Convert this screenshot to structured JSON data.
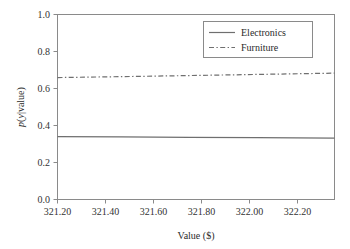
{
  "chart_data": {
    "type": "line",
    "title": "",
    "xlabel": "Value ($)",
    "ylabel": "p(y|value)",
    "ylabel_parts": {
      "p": "p",
      "open": "(",
      "y": "y",
      "rest": "|value)"
    },
    "xlim": [
      321.12,
      322.34
    ],
    "ylim": [
      0.0,
      1.0
    ],
    "grid": false,
    "legend_position": "upper right",
    "xticks": [
      321.2,
      321.4,
      321.6,
      321.8,
      322.0,
      322.2
    ],
    "xticklabels": [
      "321.20",
      "321.40",
      "321.60",
      "321.80",
      "322.00",
      "322.20"
    ],
    "yticks": [
      0.0,
      0.2,
      0.4,
      0.6,
      0.8,
      1.0
    ],
    "yticklabels": [
      "0.0",
      "0.2",
      "0.4",
      "0.6",
      "0.8",
      "1.0"
    ],
    "x": [
      321.12,
      321.4,
      321.7,
      322.0,
      322.34
    ],
    "series": [
      {
        "name": "Electronics",
        "style": "solid",
        "color": "#6f6f6f",
        "values": [
          0.34,
          0.338,
          0.336,
          0.334,
          0.332
        ]
      },
      {
        "name": "Furniture",
        "style": "dash-dot",
        "color": "#6f6f6f",
        "values": [
          0.659,
          0.664,
          0.67,
          0.676,
          0.683
        ]
      }
    ]
  },
  "legend": {
    "entries": [
      {
        "label": "Electronics",
        "style": "solid"
      },
      {
        "label": "Furniture",
        "style": "dash-dot"
      }
    ]
  },
  "colors": {
    "background": "#ffffff",
    "axis": "#8a8a8a",
    "line": "#6f6f6f",
    "text": "#2b2b2b"
  }
}
